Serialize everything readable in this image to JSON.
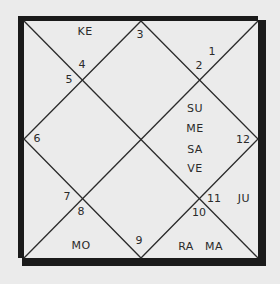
{
  "chart": {
    "style": "North Indian birth chart (diamond)",
    "colors": {
      "background": "#ebebeb",
      "frame": "#1a1a1a",
      "lines": "#2a2a2a",
      "text": "#2a2a2a"
    },
    "house_numbers": [
      {
        "id": "h1",
        "value": "1"
      },
      {
        "id": "h2",
        "value": "2"
      },
      {
        "id": "h3",
        "value": "3"
      },
      {
        "id": "h4",
        "value": "4"
      },
      {
        "id": "h5",
        "value": "5"
      },
      {
        "id": "h6",
        "value": "6"
      },
      {
        "id": "h7",
        "value": "7"
      },
      {
        "id": "h8",
        "value": "8"
      },
      {
        "id": "h9",
        "value": "9"
      },
      {
        "id": "h10",
        "value": "10"
      },
      {
        "id": "h11",
        "value": "11"
      },
      {
        "id": "h12",
        "value": "12"
      }
    ],
    "planets": [
      {
        "abbr": "KE",
        "house": "4"
      },
      {
        "abbr": "SU",
        "house": "1"
      },
      {
        "abbr": "ME",
        "house": "1"
      },
      {
        "abbr": "SA",
        "house": "1"
      },
      {
        "abbr": "VE",
        "house": "1"
      },
      {
        "abbr": "JU",
        "house": "11"
      },
      {
        "abbr": "MO",
        "house": "8"
      },
      {
        "abbr": "RA",
        "house": "10"
      },
      {
        "abbr": "MA",
        "house": "10"
      }
    ]
  }
}
